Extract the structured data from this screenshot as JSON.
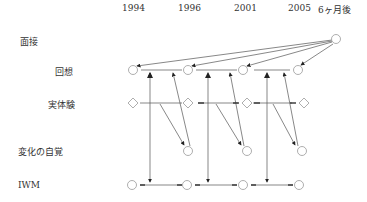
{
  "years": [
    "1994",
    "1996",
    "2001",
    "2005",
    "6ヶ月後"
  ],
  "rows": {
    "interview": "面接",
    "recall": "回想",
    "experience": "実体験",
    "awareness": "変化の自覚",
    "iwm": "IWM"
  },
  "colors": {
    "line": "#444444",
    "node": "#999999"
  }
}
